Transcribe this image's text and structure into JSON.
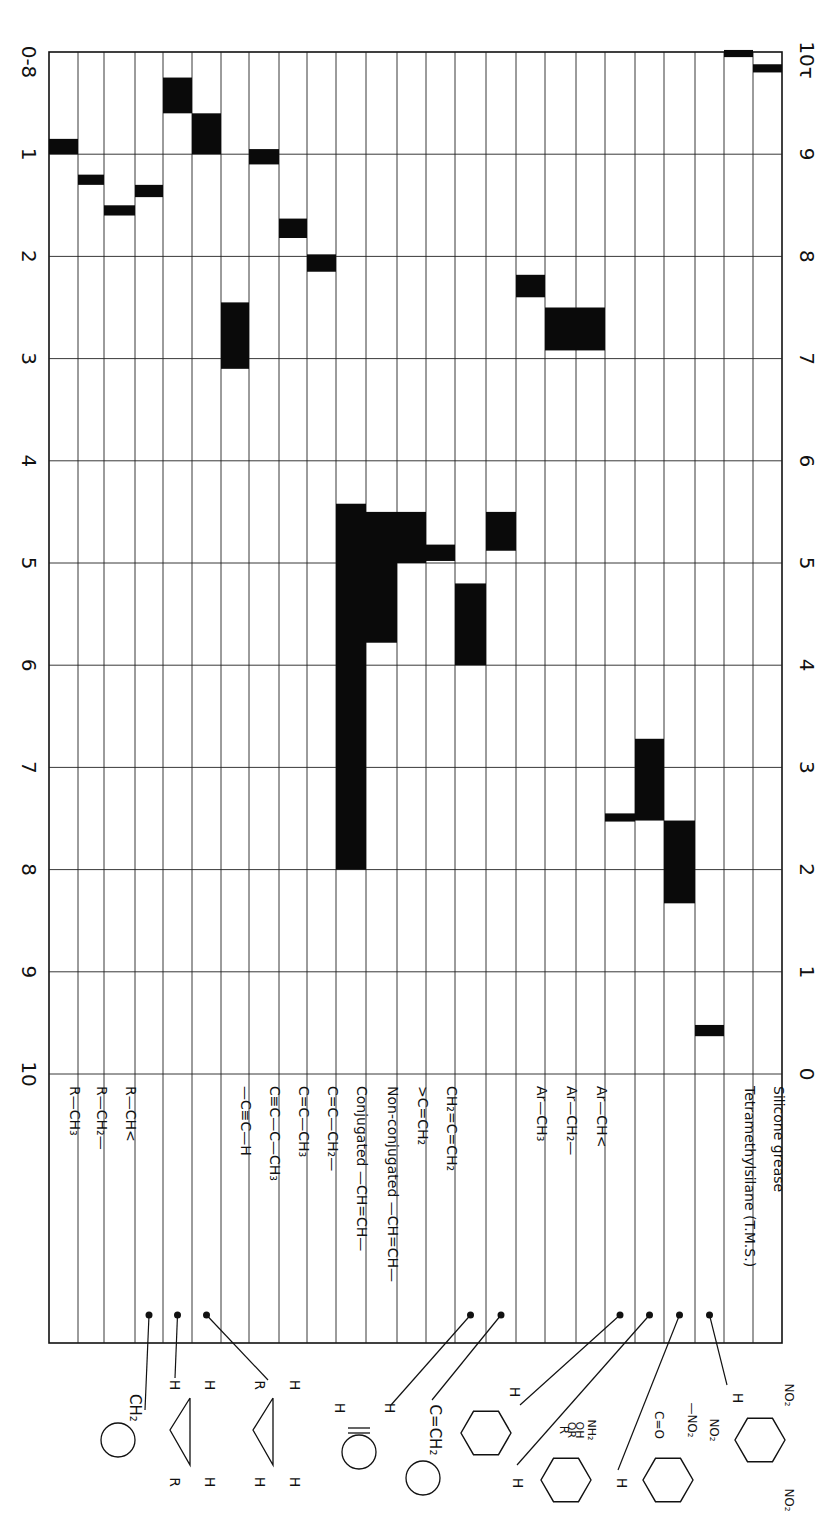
{
  "chart_data": {
    "type": "range-bar",
    "orientation": "rotated 90° (shift axis vertical, compound groups as columns)",
    "axis_delta": {
      "label": "δ",
      "corner_label": "0-8",
      "ticks": [
        "0-8",
        "1",
        "2",
        "3",
        "4",
        "5",
        "6",
        "7",
        "8",
        "9",
        "10"
      ],
      "range": [
        0,
        10
      ]
    },
    "axis_tau": {
      "label": "τ",
      "corner_label": "10τ",
      "ticks": [
        "10τ",
        "9",
        "8",
        "7",
        "6",
        "5",
        "4",
        "3",
        "2",
        "1",
        "0"
      ],
      "range": [
        10,
        0
      ]
    },
    "grid": true,
    "columns": [
      {
        "label": "R—CH₃",
        "ranges": [
          [
            0.85,
            1.0
          ]
        ]
      },
      {
        "label": "R—CH₂—",
        "ranges": [
          [
            1.2,
            1.3
          ]
        ]
      },
      {
        "label": "R—CH<",
        "ranges": [
          [
            1.5,
            1.6
          ]
        ]
      },
      {
        "label": "",
        "pointer": "cyclopropane CH₂ ring",
        "ranges": [
          [
            1.3,
            1.42
          ]
        ]
      },
      {
        "label": "",
        "pointer": "cyclopropane cis H,H",
        "ranges": [
          [
            0.25,
            0.6
          ]
        ]
      },
      {
        "label": "",
        "pointer": "cyclopropane R,H",
        "ranges": [
          [
            0.6,
            1.0
          ]
        ]
      },
      {
        "label": "—C≡C—H",
        "ranges": [
          [
            2.45,
            3.1
          ]
        ]
      },
      {
        "label": "C≡C—C—CH₃",
        "ranges": [
          [
            0.95,
            1.1
          ]
        ]
      },
      {
        "label": "C=C—CH₃",
        "ranges": [
          [
            1.63,
            1.82
          ]
        ]
      },
      {
        "label": "C=C—CH₂—",
        "ranges": [
          [
            1.98,
            2.15
          ]
        ]
      },
      {
        "label": "Conjugated —CH=CH—",
        "ranges": [
          [
            4.42,
            8.0
          ]
        ]
      },
      {
        "label": "Non-conjugated —CH=CH—",
        "ranges": [
          [
            4.5,
            5.78
          ]
        ]
      },
      {
        "label": ">C=CH₂",
        "ranges": [
          [
            4.5,
            5.0
          ]
        ]
      },
      {
        "label": "CH₂=C=CH₂",
        "ranges": [
          [
            4.82,
            4.98
          ]
        ]
      },
      {
        "label": "",
        "pointer": "cyclic ene H",
        "ranges": [
          [
            5.2,
            6.0
          ]
        ]
      },
      {
        "label": "",
        "pointer": "exocyclic C=CH₂",
        "ranges": [
          [
            4.5,
            4.88
          ]
        ]
      },
      {
        "label": "Ar—CH₃",
        "ranges": [
          [
            2.18,
            2.4
          ]
        ]
      },
      {
        "label": "Ar—CH₂—",
        "ranges": [
          [
            2.5,
            2.92
          ]
        ]
      },
      {
        "label": "Ar—CH<",
        "ranges": [
          [
            2.5,
            2.92
          ]
        ]
      },
      {
        "label": "",
        "pointer": "benzene H",
        "ranges": [
          [
            7.45,
            7.53
          ]
        ]
      },
      {
        "label": "",
        "pointer": "Ar-H with R, OR, OH, NH₂",
        "ranges": [
          [
            6.72,
            7.52
          ]
        ]
      },
      {
        "label": "",
        "pointer": "Ar-H with C=O, NO₂",
        "ranges": [
          [
            7.52,
            8.33
          ]
        ]
      },
      {
        "label": "",
        "pointer": "1,3,5-trinitrobenzene H",
        "ranges": [
          [
            9.52,
            9.63
          ]
        ]
      },
      {
        "label": "Tetramethylsilane (T.M.S.)",
        "ranges": [
          [
            -0.02,
            0.05
          ]
        ]
      },
      {
        "label": "Silicone grease",
        "ranges": [
          [
            0.12,
            0.2
          ]
        ]
      }
    ],
    "structures": [
      {
        "name": "cyclic-CH2",
        "text": "CH₂"
      },
      {
        "name": "cyclopropane-HH",
        "text": "H H / R H"
      },
      {
        "name": "cyclopropane-RH",
        "text": "R H / H H"
      },
      {
        "name": "cycloalkene-HH",
        "text": "H H"
      },
      {
        "name": "exocyclic-methylene",
        "text": "C=CH₂"
      },
      {
        "name": "benzene-H",
        "text": "H"
      },
      {
        "name": "substituted-benzene-donor",
        "text": "H ; R, OR, OH, NH₂"
      },
      {
        "name": "substituted-benzene-acceptor",
        "text": "H ; C=O, —NO₂"
      },
      {
        "name": "trinitrobenzene",
        "text": "H ; NO₂, NO₂, NO₂"
      }
    ]
  },
  "labels": {
    "delta_corner": "0-8",
    "tau_corner": "10τ"
  }
}
